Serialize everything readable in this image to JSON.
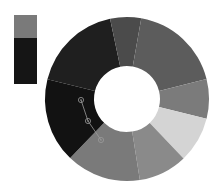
{
  "chart_data": {
    "type": "donut",
    "title": "",
    "center": [
      127,
      99
    ],
    "outer_radius": 82,
    "inner_radius": 33,
    "start_angle_deg": 284,
    "segments": [
      {
        "name": "H",
        "value": 17.8,
        "color": "#1f1f1f"
      },
      {
        "name": "A",
        "value": 6.1,
        "color": "#4b4b4b"
      },
      {
        "name": "B",
        "value": 18.3,
        "color": "#5c5c5c"
      },
      {
        "name": "C",
        "value": 7.8,
        "color": "#7b7b7b"
      },
      {
        "name": "D",
        "value": 9.0,
        "color": "#d4d4d4"
      },
      {
        "name": "E",
        "value": 9.6,
        "color": "#8a8a8a"
      },
      {
        "name": "F",
        "value": 14.7,
        "color": "#7a7a7a"
      },
      {
        "name": "G",
        "value": 16.7,
        "color": "#121212"
      }
    ],
    "legend": {
      "position": "top-left",
      "swatches": [
        {
          "color": "#7a7a7a",
          "height": 23
        },
        {
          "color": "#151515",
          "height": 46
        }
      ]
    },
    "annotations": {
      "polyline_color": "#9a9a9a",
      "markers": [
        [
          81,
          100
        ],
        [
          88,
          121
        ],
        [
          101,
          140
        ]
      ]
    }
  }
}
